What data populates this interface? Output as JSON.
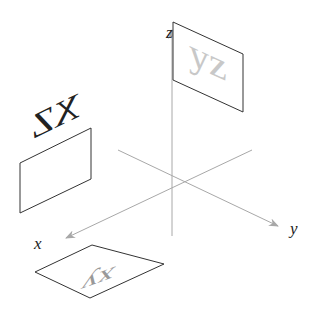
{
  "diagram": {
    "type": "3d-coordinate-axes-with-projection-planes",
    "axes": {
      "x": {
        "label": "x"
      },
      "y": {
        "label": "y"
      },
      "z": {
        "label": "z"
      }
    },
    "planes": [
      {
        "name": "yz",
        "text": "yz",
        "text_color": "#c8c8c8",
        "position": "top-right, attached to z-axis"
      },
      {
        "name": "xz",
        "text": "XZ",
        "text_color": "#222222",
        "position": "left",
        "mirrored": true
      },
      {
        "name": "xy",
        "text": "xy",
        "text_color": "#999999",
        "position": "bottom",
        "mirrored": true
      }
    ],
    "colors": {
      "axis": "#a8a8a8",
      "plane_border": "#333333",
      "background": "#ffffff"
    }
  }
}
